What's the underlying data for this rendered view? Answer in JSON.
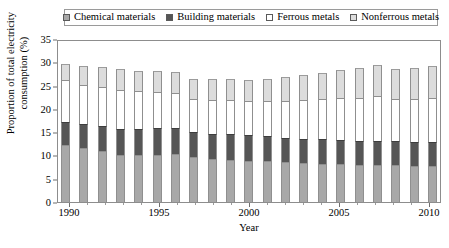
{
  "chart_data": {
    "type": "bar",
    "subtype": "stacked-column",
    "title": "",
    "xlabel": "Year",
    "ylabel": "Proportion of total electricity consumption (%)",
    "ylim": [
      0,
      35
    ],
    "ytick_values": [
      0,
      5,
      10,
      15,
      20,
      25,
      30,
      35
    ],
    "ytick_labels": [
      "0",
      "5",
      "10",
      "15",
      "20",
      "25",
      "30",
      "35"
    ],
    "xtick_labels": [
      "1990",
      "1995",
      "2000",
      "2005",
      "2010"
    ],
    "xtick_years": [
      1990,
      1995,
      2000,
      2005,
      2010
    ],
    "grid": false,
    "legend_position": "top",
    "categories": [
      "1990",
      "1991",
      "1992",
      "1993",
      "1994",
      "1995",
      "1996",
      "1997",
      "1998",
      "1999",
      "2000",
      "2001",
      "2002",
      "2003",
      "2004",
      "2005",
      "2006",
      "2007",
      "2008",
      "2009",
      "2010"
    ],
    "series": [
      {
        "name": "Chemical materials",
        "color": "#a8a8a8",
        "values": [
          12.3,
          11.6,
          10.9,
          10.1,
          10.1,
          10.2,
          10.3,
          9.6,
          9.2,
          9.1,
          8.8,
          8.7,
          8.5,
          8.3,
          8.2,
          8.2,
          8.0,
          8.0,
          7.9,
          7.7,
          7.7
        ]
      },
      {
        "name": "Building materials",
        "color": "#565656",
        "values": [
          4.8,
          5.1,
          5.5,
          5.6,
          5.6,
          5.7,
          5.7,
          5.4,
          5.3,
          5.6,
          5.5,
          5.4,
          5.3,
          5.3,
          5.3,
          5.2,
          5.2,
          5.2,
          5.1,
          5.1,
          5.1
        ]
      },
      {
        "name": "Ferrous metals",
        "color": "#ffffff",
        "values": [
          9.2,
          8.5,
          8.2,
          8.3,
          8.1,
          7.8,
          7.5,
          7.2,
          7.4,
          7.3,
          7.3,
          7.6,
          8.0,
          8.4,
          8.7,
          9.0,
          9.2,
          9.6,
          9.2,
          9.3,
          9.5
        ]
      },
      {
        "name": "Nonferrous metals",
        "color": "#dcdcdc",
        "values": [
          3.4,
          4.1,
          4.3,
          4.6,
          4.4,
          4.4,
          4.4,
          4.3,
          4.5,
          4.5,
          4.6,
          4.8,
          5.0,
          5.3,
          5.6,
          6.0,
          6.3,
          6.6,
          6.4,
          6.6,
          6.9
        ]
      }
    ],
    "totals": [
      29.7,
      29.3,
      28.9,
      28.6,
      28.2,
      28.1,
      27.9,
      26.5,
      26.4,
      26.5,
      26.2,
      26.5,
      26.8,
      27.3,
      27.8,
      28.4,
      28.7,
      29.4,
      28.6,
      28.7,
      29.2
    ]
  }
}
